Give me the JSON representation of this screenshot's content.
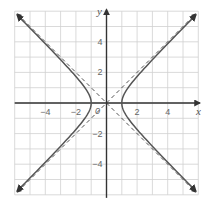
{
  "chart_data": {
    "type": "line",
    "title": "",
    "xlabel": "x",
    "ylabel": "y",
    "xlim": [
      -6,
      6
    ],
    "ylim": [
      -6,
      6
    ],
    "grid": true,
    "grid_step": 1,
    "x_ticks": [
      -4,
      -2,
      2,
      4
    ],
    "y_ticks": [
      4,
      2,
      -2,
      -4
    ],
    "x_tick_labels": [
      "−4",
      "−2",
      "2",
      "4"
    ],
    "y_tick_labels": [
      "4",
      "2",
      "−2",
      "−4"
    ],
    "origin_label": "0",
    "equation": "x^2 - y^2 = 1",
    "vertices": [
      [
        -1,
        0
      ],
      [
        1,
        0
      ]
    ],
    "series": [
      {
        "name": "hyperbola right branch",
        "style": "solid",
        "color": "#555555",
        "points": [
          [
            5.9,
            -5.8
          ],
          [
            3.0,
            -2.83
          ],
          [
            2.0,
            -1.73
          ],
          [
            1.5,
            -1.12
          ],
          [
            1.0,
            0
          ],
          [
            1.5,
            1.12
          ],
          [
            2.0,
            1.73
          ],
          [
            3.0,
            2.83
          ],
          [
            5.9,
            5.8
          ]
        ]
      },
      {
        "name": "hyperbola left branch",
        "style": "solid",
        "color": "#555555",
        "points": [
          [
            -5.9,
            5.8
          ],
          [
            -3.0,
            2.83
          ],
          [
            -2.0,
            1.73
          ],
          [
            -1.5,
            1.12
          ],
          [
            -1.0,
            0
          ],
          [
            -1.5,
            -1.12
          ],
          [
            -2.0,
            -1.73
          ],
          [
            -3.0,
            -2.83
          ],
          [
            -5.9,
            -5.8
          ]
        ]
      },
      {
        "name": "asymptote y = x",
        "style": "dashed",
        "color": "#555555",
        "points": [
          [
            -6,
            -6
          ],
          [
            6,
            6
          ]
        ]
      },
      {
        "name": "asymptote y = -x",
        "style": "dashed",
        "color": "#555555",
        "points": [
          [
            -6,
            6
          ],
          [
            6,
            -6
          ]
        ]
      }
    ],
    "colors": {
      "grid": "#d0d0d0",
      "axis": "#333333",
      "curve": "#555555",
      "background": "#ffffff"
    }
  }
}
